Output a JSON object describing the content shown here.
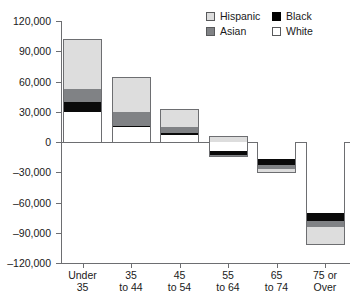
{
  "chart_data": {
    "type": "bar",
    "subtype": "stacked-bar-with-negative-values",
    "title": "",
    "xlabel": "",
    "ylabel": "",
    "categories": [
      "Under\n35",
      "35\nto 44",
      "45\nto 54",
      "55\nto 64",
      "65\nto 74",
      "75 or\nOver"
    ],
    "ylim": [
      -120000,
      120000
    ],
    "yticks": [
      120000,
      90000,
      60000,
      30000,
      0,
      -30000,
      -60000,
      -90000,
      -120000
    ],
    "ytick_labels": [
      "120,000",
      "90,000",
      "60,000",
      "30,000",
      "0",
      "–30,000",
      "–60,000",
      "–90,000",
      "–120,000"
    ],
    "grid": false,
    "legend_position": "top-right",
    "series": [
      {
        "name": "White",
        "color": "#ffffff",
        "values": [
          30000,
          15000,
          7000,
          -9000,
          -17000,
          -70000
        ]
      },
      {
        "name": "Black",
        "color": "#000000",
        "values": [
          10000,
          1000,
          2000,
          -4000,
          -6000,
          -8000
        ]
      },
      {
        "name": "Asian",
        "color": "#808285",
        "values": [
          13000,
          14000,
          6000,
          -2000,
          -4000,
          -6000
        ]
      },
      {
        "name": "Hispanic",
        "color": "#dddddd",
        "values": [
          49000,
          34000,
          18000,
          6000,
          -4000,
          -18000
        ]
      }
    ],
    "bar_totals_positive": [
      102000,
      64000,
      33000,
      6000,
      0,
      0
    ],
    "bar_totals_negative": [
      0,
      0,
      0,
      -15000,
      -31000,
      -102000
    ]
  },
  "legend": {
    "items": [
      {
        "label": "Hispanic",
        "swatch": "hispanic"
      },
      {
        "label": "Black",
        "swatch": "black"
      },
      {
        "label": "Asian",
        "swatch": "asian"
      },
      {
        "label": "White",
        "swatch": "white"
      }
    ]
  },
  "axis": {
    "y_labels": [
      "120,000",
      "90,000",
      "60,000",
      "30,000",
      "0",
      "–30,000",
      "–60,000",
      "–90,000",
      "–120,000"
    ],
    "x_labels": [
      "Under\n35",
      "35\nto 44",
      "45\nto 54",
      "55\nto 64",
      "65\nto 74",
      "75 or\nOver"
    ]
  },
  "colors": {
    "hispanic": "#dddddd",
    "asian": "#808285",
    "black": "#000000",
    "white": "#ffffff",
    "axis": "#6d6e71",
    "text": "#1a1a1a"
  }
}
